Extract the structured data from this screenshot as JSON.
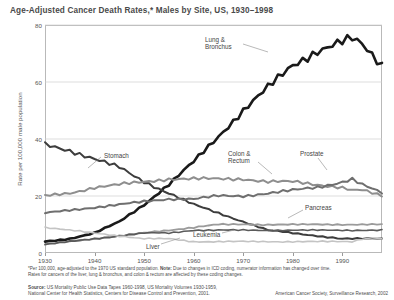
{
  "title": "Age-Adjusted Cancer Death Rates,* Males by Site, US, 1930–1998",
  "axis": {
    "ylabel": "Rate per 100,000 male population",
    "yticks": [
      0,
      20,
      40,
      60,
      80
    ],
    "xticks": [
      1930,
      1940,
      1950,
      1960,
      1970,
      1980,
      1990
    ]
  },
  "notes": {
    "line1_a": "*Per 100,000, age-adjusted to the 1970 US standard population.",
    "line1_b": "Note:",
    "line1_c": "Due to changes in ICD coding, numerator information has changed over time.",
    "line2": "Rates for cancers of the liver, lung & bronchus, and colon & rectum are affected by these coding changes.",
    "source_bold": "Source:",
    "source_1": "US Mortality Public Use Data Tapes 1960-1998, US Mortality Volumes 1930-1959,",
    "source_2": "National Center for Health Statistics, Centers for Disease Control and Prevention, 2001.",
    "credit": "American Cancer Society, Surveillance Research, 2002"
  },
  "chart_data": {
    "type": "line",
    "title": "Age-Adjusted Cancer Death Rates,* Males by Site, US, 1930–1998",
    "xlabel": "",
    "ylabel": "Rate per 100,000 male population",
    "xlim": [
      1930,
      1998
    ],
    "ylim": [
      0,
      80
    ],
    "grid": "horizontal",
    "legend": "inline-annotations",
    "x": [
      1930,
      1935,
      1940,
      1945,
      1950,
      1955,
      1960,
      1965,
      1970,
      1975,
      1980,
      1985,
      1990,
      1992,
      1994,
      1998
    ],
    "series": [
      {
        "name": "Lung & Bronchus",
        "color": "#1a1a1a",
        "width": 2.6,
        "values": [
          4,
          5,
          7,
          11,
          17,
          24,
          32,
          41,
          50,
          58,
          66,
          71,
          74,
          75,
          73,
          66
        ],
        "label_pos": {
          "x": 205,
          "y": 36
        },
        "leader": [
          [
            243,
            44
          ],
          [
            268,
            52
          ]
        ]
      },
      {
        "name": "Stomach",
        "color": "#3d3d3d",
        "width": 2.0,
        "values": [
          38,
          36,
          33,
          30,
          25,
          21,
          17,
          14,
          11,
          8,
          7,
          6,
          5,
          5,
          5,
          5
        ],
        "label_pos": {
          "x": 104,
          "y": 152
        },
        "leader": [
          [
            101,
            157
          ],
          [
            88,
            168
          ]
        ]
      },
      {
        "name": "Colon & Rectum",
        "color": "#8e8e8e",
        "width": 2.0,
        "values": [
          20,
          21,
          23,
          24,
          25,
          26,
          26,
          26,
          26,
          25,
          25,
          24,
          23,
          22,
          22,
          20
        ],
        "label_pos": {
          "x": 228,
          "y": 150
        },
        "leader": [
          [
            258,
            162
          ],
          [
            272,
            174
          ]
        ]
      },
      {
        "name": "Prostate",
        "color": "#6f6f6f",
        "width": 2.0,
        "values": [
          14,
          15,
          16,
          17,
          18,
          19,
          19,
          20,
          20,
          21,
          22,
          23,
          25,
          26,
          24,
          21
        ],
        "label_pos": {
          "x": 300,
          "y": 150
        },
        "leader": [
          [
            318,
            158
          ],
          [
            327,
            170
          ]
        ]
      },
      {
        "name": "Pancreas",
        "color": "#9b9b9b",
        "width": 1.8,
        "values": [
          3,
          4,
          5,
          6,
          7,
          8,
          9,
          10,
          10,
          10,
          10,
          10,
          10,
          10,
          10,
          10
        ],
        "label_pos": {
          "x": 305,
          "y": 204
        },
        "leader": [
          [
            303,
            210
          ],
          [
            288,
            218
          ]
        ]
      },
      {
        "name": "Leukemia",
        "color": "#5a5a5a",
        "width": 1.6,
        "values": [
          3,
          4,
          5,
          6,
          7,
          7,
          8,
          8,
          8,
          8,
          8,
          8,
          8,
          8,
          8,
          8
        ],
        "label_pos": {
          "x": 193,
          "y": 231
        },
        "leader": [
          [
            222,
            233
          ],
          [
            234,
            230
          ]
        ]
      },
      {
        "name": "Liver",
        "color": "#c4c4c4",
        "width": 1.6,
        "values": [
          9,
          8,
          7,
          6,
          5,
          5,
          4,
          4,
          4,
          4,
          4,
          4,
          4,
          4,
          5,
          5
        ],
        "label_pos": {
          "x": 146,
          "y": 243
        },
        "leader": [
          [
            161,
            244
          ],
          [
            180,
            238
          ]
        ]
      }
    ]
  }
}
